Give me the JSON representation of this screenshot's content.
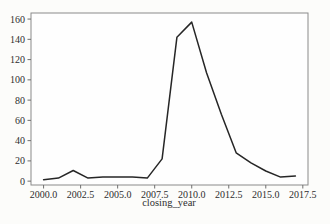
{
  "figure": {
    "background": "#fcfcfa",
    "plot_background": "#fefefe",
    "spine_color": "#8a8a8a",
    "tick_mark_color": "#6f6f6f",
    "text_color": "#2e2e2e",
    "width": 330,
    "height": 224
  },
  "chart_data": {
    "type": "line",
    "title": "",
    "xlabel": "closing_year",
    "ylabel": "",
    "grid": false,
    "legend_position": "none",
    "line_color": "#262626",
    "line_width": 1.5,
    "markers": false,
    "x": [
      2000,
      2001,
      2002,
      2003,
      2004,
      2005,
      2006,
      2007,
      2008,
      2009,
      2010,
      2011,
      2012,
      2013,
      2014,
      2015,
      2016,
      2017
    ],
    "y": [
      1.5,
      3,
      10.5,
      3,
      4,
      4,
      4,
      3,
      22,
      142,
      157,
      107,
      66,
      28,
      18,
      10,
      4,
      5
    ],
    "xlim": [
      1999.15,
      2017.85
    ],
    "ylim": [
      -3.8,
      166
    ],
    "xticks": [
      {
        "value": 2000.0,
        "label": "2000.0"
      },
      {
        "value": 2002.5,
        "label": "2002.5"
      },
      {
        "value": 2005.0,
        "label": "2005.0"
      },
      {
        "value": 2007.5,
        "label": "2007.5"
      },
      {
        "value": 2010.0,
        "label": "2010.0"
      },
      {
        "value": 2012.5,
        "label": "2012.5"
      },
      {
        "value": 2015.0,
        "label": "2015.0"
      },
      {
        "value": 2017.5,
        "label": "2017.5"
      }
    ],
    "yticks": [
      {
        "value": 0,
        "label": "0"
      },
      {
        "value": 20,
        "label": "20"
      },
      {
        "value": 40,
        "label": "40"
      },
      {
        "value": 60,
        "label": "60"
      },
      {
        "value": 80,
        "label": "80"
      },
      {
        "value": 100,
        "label": "100"
      },
      {
        "value": 120,
        "label": "120"
      },
      {
        "value": 140,
        "label": "140"
      },
      {
        "value": 160,
        "label": "160"
      }
    ]
  }
}
